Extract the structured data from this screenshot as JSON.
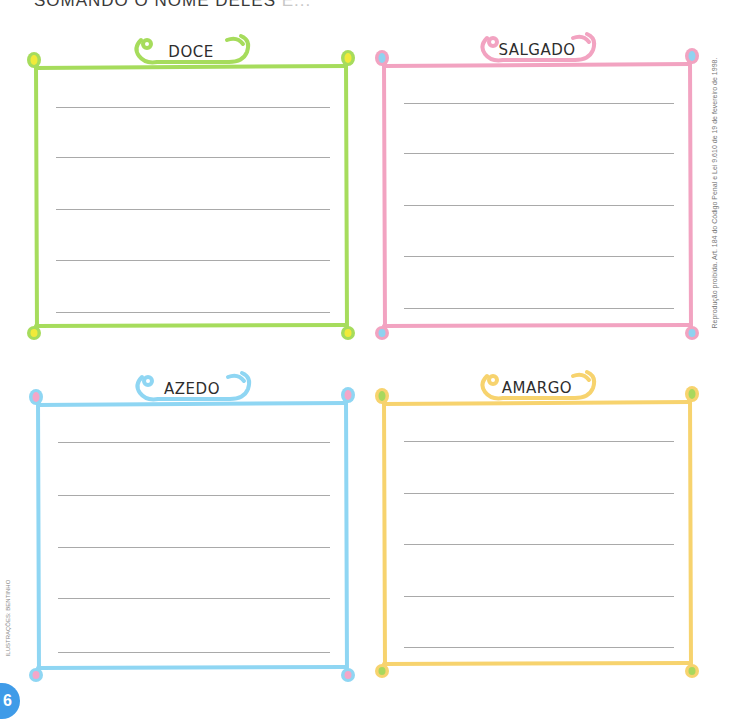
{
  "header": {
    "instruction_visible": "SOMANDO O NOME DELES",
    "instruction_faded": " E..."
  },
  "panels": [
    {
      "id": "doce",
      "title": "DOCE",
      "frame_color": "#a6dc5c",
      "corner_inner_color": "#f1ea3a",
      "line_count": 5
    },
    {
      "id": "salgado",
      "title": "SALGADO",
      "frame_color": "#f2a3c1",
      "corner_inner_color": "#8fd3f0",
      "line_count": 5
    },
    {
      "id": "azedo",
      "title": "AZEDO",
      "frame_color": "#8fd6f3",
      "corner_inner_color": "#f4a6c8",
      "line_count": 5
    },
    {
      "id": "amargo",
      "title": "AMARGO",
      "frame_color": "#f7d36e",
      "corner_inner_color": "#a8d85e",
      "line_count": 5
    }
  ],
  "side_note": "Reprodução proibida. Art. 184 do Código Penal e Lei 9.610 de 19 de fevereiro de 1998.",
  "credit": "ILUSTRAÇÕES: BENTINHO",
  "page_number": "6"
}
